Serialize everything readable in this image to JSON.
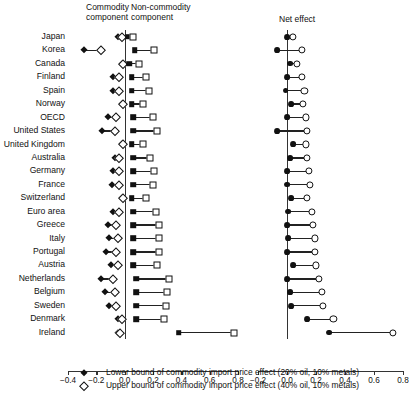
{
  "headers": {
    "commodity": "Commodity\ncomponent",
    "noncommodity": "Non-commodity\ncomponent",
    "net": "Net effect"
  },
  "legend": [
    {
      "marker": "filled-diamond",
      "label": "Lower bound of commodity import price effect (20% oil, 10% metals)"
    },
    {
      "marker": "open-diamond",
      "label": "Upper bound of commodity import price effect (40% oil, 10% metals)"
    }
  ],
  "chart_data": {
    "type": "scatter",
    "title": "",
    "xlabel": "",
    "ylabel": "",
    "grid": false,
    "legend_position": "bottom",
    "panels": [
      {
        "name": "left",
        "headers": [
          "Commodity component",
          "Non-commodity component"
        ],
        "xlim": [
          -0.4,
          0.8
        ],
        "xticks": [
          -0.4,
          -0.2,
          0.0,
          0.2,
          0.4,
          0.6,
          0.8
        ],
        "xticklabels": [
          "-0.4",
          "-0.2",
          "0.0",
          "0.2",
          "0.4",
          "0.6",
          "0.8"
        ],
        "series": [
          {
            "name": "Commodity lower bound",
            "marker": "filled-diamond"
          },
          {
            "name": "Commodity upper bound",
            "marker": "open-diamond"
          },
          {
            "name": "Non-commodity lower bound",
            "marker": "filled-square"
          },
          {
            "name": "Non-commodity upper bound",
            "marker": "open-square"
          }
        ]
      },
      {
        "name": "right",
        "headers": [
          "Net effect"
        ],
        "xlim": [
          -0.2,
          0.8
        ],
        "xticks": [
          -0.2,
          0.0,
          0.2,
          0.4,
          0.6,
          0.8
        ],
        "xticklabels": [
          "-0.2",
          "0.0",
          "0.2",
          "0.4",
          "0.6",
          "0.8"
        ],
        "series": [
          {
            "name": "Net lower bound",
            "marker": "filled-circle"
          },
          {
            "name": "Net upper bound",
            "marker": "open-circle"
          }
        ]
      }
    ],
    "categories": [
      "Japan",
      "Korea",
      "Canada",
      "Finland",
      "Spain",
      "Norway",
      "OECD",
      "United States",
      "United Kingdom",
      "Australia",
      "Germany",
      "France",
      "Switzerland",
      "Euro area",
      "Greece",
      "Italy",
      "Portugal",
      "Austria",
      "Netherlands",
      "Belgium",
      "Sweden",
      "Denmark",
      "Ireland"
    ],
    "rows": [
      {
        "country": "Japan",
        "comm_low": -0.05,
        "comm_up": -0.02,
        "noncomm_low": 0.02,
        "noncomm_up": 0.06,
        "net_low": 0.0,
        "net_up": 0.04
      },
      {
        "country": "Korea",
        "comm_low": -0.29,
        "comm_up": -0.17,
        "noncomm_low": 0.07,
        "noncomm_up": 0.21,
        "net_low": -0.07,
        "net_up": 0.1
      },
      {
        "country": "Canada",
        "comm_low": -0.02,
        "comm_up": -0.01,
        "noncomm_low": 0.03,
        "noncomm_up": 0.1,
        "net_low": 0.02,
        "net_up": 0.07
      },
      {
        "country": "Finland",
        "comm_low": -0.08,
        "comm_up": -0.04,
        "noncomm_low": 0.05,
        "noncomm_up": 0.15,
        "net_low": 0.0,
        "net_up": 0.1
      },
      {
        "country": "Spain",
        "comm_low": -0.08,
        "comm_up": -0.04,
        "noncomm_low": 0.05,
        "noncomm_up": 0.17,
        "net_low": -0.01,
        "net_up": 0.12
      },
      {
        "country": "Norway",
        "comm_low": -0.02,
        "comm_up": -0.01,
        "noncomm_low": 0.05,
        "noncomm_up": 0.13,
        "net_low": 0.03,
        "net_up": 0.11
      },
      {
        "country": "OECD",
        "comm_low": -0.12,
        "comm_up": -0.06,
        "noncomm_low": 0.06,
        "noncomm_up": 0.2,
        "net_low": 0.0,
        "net_up": 0.13
      },
      {
        "country": "United States",
        "comm_low": -0.16,
        "comm_up": -0.07,
        "noncomm_low": 0.06,
        "noncomm_up": 0.23,
        "net_low": -0.07,
        "net_up": 0.14
      },
      {
        "country": "United Kingdom",
        "comm_low": -0.02,
        "comm_up": -0.01,
        "noncomm_low": 0.05,
        "noncomm_up": 0.13,
        "net_low": 0.04,
        "net_up": 0.13
      },
      {
        "country": "Australia",
        "comm_low": -0.07,
        "comm_up": -0.04,
        "noncomm_low": 0.06,
        "noncomm_up": 0.18,
        "net_low": 0.02,
        "net_up": 0.14
      },
      {
        "country": "Germany",
        "comm_low": -0.08,
        "comm_up": -0.04,
        "noncomm_low": 0.06,
        "noncomm_up": 0.21,
        "net_low": 0.0,
        "net_up": 0.15
      },
      {
        "country": "France",
        "comm_low": -0.09,
        "comm_up": -0.04,
        "noncomm_low": 0.06,
        "noncomm_up": 0.2,
        "net_low": 0.0,
        "net_up": 0.16
      },
      {
        "country": "Switzerland",
        "comm_low": -0.02,
        "comm_up": -0.01,
        "noncomm_low": 0.05,
        "noncomm_up": 0.15,
        "net_low": 0.03,
        "net_up": 0.14
      },
      {
        "country": "Euro area",
        "comm_low": -0.08,
        "comm_up": -0.04,
        "noncomm_low": 0.06,
        "noncomm_up": 0.22,
        "net_low": 0.01,
        "net_up": 0.17
      },
      {
        "country": "Greece",
        "comm_low": -0.12,
        "comm_up": -0.06,
        "noncomm_low": 0.06,
        "noncomm_up": 0.24,
        "net_low": 0.0,
        "net_up": 0.18
      },
      {
        "country": "Italy",
        "comm_low": -0.11,
        "comm_up": -0.05,
        "noncomm_low": 0.06,
        "noncomm_up": 0.24,
        "net_low": 0.01,
        "net_up": 0.19
      },
      {
        "country": "Portugal",
        "comm_low": -0.13,
        "comm_up": -0.06,
        "noncomm_low": 0.06,
        "noncomm_up": 0.24,
        "net_low": 0.0,
        "net_up": 0.19
      },
      {
        "country": "Austria",
        "comm_low": -0.1,
        "comm_up": -0.05,
        "noncomm_low": 0.06,
        "noncomm_up": 0.23,
        "net_low": 0.04,
        "net_up": 0.2
      },
      {
        "country": "Netherlands",
        "comm_low": -0.17,
        "comm_up": -0.08,
        "noncomm_low": 0.08,
        "noncomm_up": 0.31,
        "net_low": 0.0,
        "net_up": 0.22
      },
      {
        "country": "Belgium",
        "comm_low": -0.14,
        "comm_up": -0.07,
        "noncomm_low": 0.08,
        "noncomm_up": 0.3,
        "net_low": 0.02,
        "net_up": 0.24
      },
      {
        "country": "Sweden",
        "comm_low": -0.11,
        "comm_up": -0.06,
        "noncomm_low": 0.08,
        "noncomm_up": 0.29,
        "net_low": 0.03,
        "net_up": 0.25
      },
      {
        "country": "Denmark",
        "comm_low": -0.05,
        "comm_up": -0.02,
        "noncomm_low": 0.08,
        "noncomm_up": 0.28,
        "net_low": 0.14,
        "net_up": 0.32
      },
      {
        "country": "Ireland",
        "comm_low": -0.05,
        "comm_up": -0.03,
        "noncomm_low": 0.38,
        "noncomm_up": 0.77,
        "net_low": 0.29,
        "net_up": 0.73
      }
    ]
  }
}
